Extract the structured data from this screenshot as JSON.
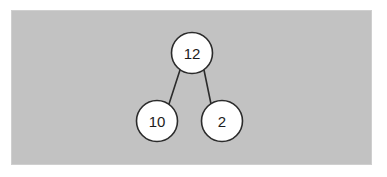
{
  "diagram": {
    "kind": "binary-tree",
    "background_color": "#c2c2c2",
    "page_color": "#ffffff",
    "node_fill": "#ffffff",
    "node_stroke": "#2b2b2b",
    "edge_color": "#2b2b2b",
    "label_color": "#1c1c1c",
    "panel": {
      "x": 12,
      "y": 11,
      "width": 359,
      "height": 153
    },
    "nodes": [
      {
        "id": "root",
        "label": "12",
        "cx": 192,
        "cy": 53,
        "r": 20.5
      },
      {
        "id": "left",
        "label": "10",
        "cx": 157,
        "cy": 121,
        "r": 20.5
      },
      {
        "id": "right",
        "label": "2",
        "cx": 222,
        "cy": 121,
        "r": 20.5
      }
    ],
    "edges": [
      {
        "id": "root-left",
        "from": "root",
        "to": "left",
        "x1": 180,
        "y1": 70,
        "x2": 169,
        "y2": 104
      },
      {
        "id": "root-right",
        "from": "root",
        "to": "right",
        "x1": 204,
        "y1": 70,
        "x2": 211,
        "y2": 104
      }
    ]
  }
}
